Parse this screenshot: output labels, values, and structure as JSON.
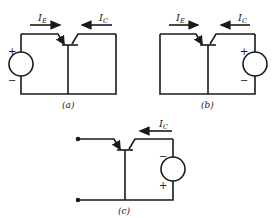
{
  "figure": {
    "panels": [
      {
        "id": "a",
        "caption": "(a)",
        "currents": [
          {
            "symbol": "I",
            "subscript": "E",
            "arrow": "right"
          },
          {
            "symbol": "I",
            "subscript": "C",
            "arrow": "left"
          }
        ],
        "source": {
          "side": "left",
          "top_sign": "+",
          "bottom_sign": "−"
        }
      },
      {
        "id": "b",
        "caption": "(b)",
        "currents": [
          {
            "symbol": "I",
            "subscript": "E",
            "arrow": "right"
          },
          {
            "symbol": "I",
            "subscript": "C",
            "arrow": "left"
          }
        ],
        "source": {
          "side": "right",
          "top_sign": "+",
          "bottom_sign": "−"
        }
      },
      {
        "id": "c",
        "caption": "(c)",
        "currents": [
          {
            "symbol": "I",
            "subscript": "C",
            "arrow": "left"
          }
        ],
        "source": {
          "side": "right",
          "top_sign": "−",
          "bottom_sign": "+"
        },
        "terminals": "open-left"
      }
    ]
  },
  "colors": {
    "ink": "#1a1a1a",
    "background": "#ffffff"
  }
}
